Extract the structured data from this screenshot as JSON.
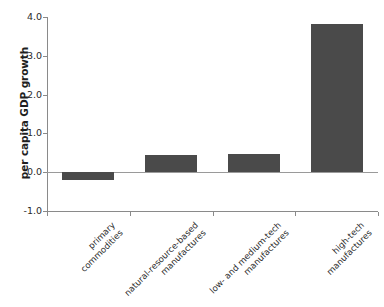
{
  "chart_data": {
    "type": "bar",
    "title": "",
    "xlabel": "",
    "ylabel": "per capita GDP growth",
    "categories": [
      "primary commodities",
      "natural-resource-based manufactures",
      "low- and medium-tech manufactures",
      "high-tech manufactures"
    ],
    "category_lines": [
      [
        "primary",
        "commodities"
      ],
      [
        "natural-resource-based",
        "manufactures"
      ],
      [
        "low- and medium-tech",
        "manufactures"
      ],
      [
        "high-tech",
        "manufactures"
      ]
    ],
    "values": [
      -0.21,
      0.44,
      0.47,
      3.82
    ],
    "ylim": [
      -1.0,
      4.0
    ],
    "yticks": [
      4.0,
      3.0,
      2.0,
      1.0,
      0.0,
      -1.0
    ],
    "ytick_labels": [
      "4.0",
      "3.0",
      "2.0",
      "1.0",
      "0.0",
      "-1.0"
    ],
    "grid": false,
    "legend": null,
    "bar_color": "#4a4a4a",
    "axis_color": "#8a8a8a",
    "zero_line": 0.0
  }
}
